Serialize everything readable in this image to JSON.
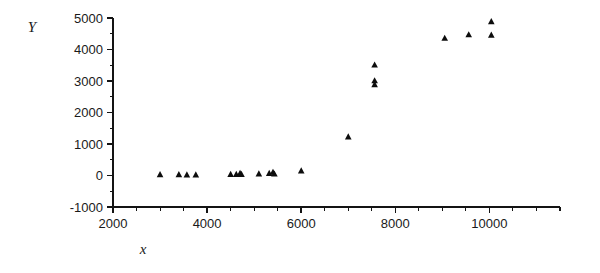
{
  "chart_data": {
    "type": "scatter",
    "title": "",
    "xlabel": "x",
    "ylabel": "Y",
    "xlim": [
      2000,
      11500
    ],
    "ylim": [
      -1000,
      5000
    ],
    "grid": false,
    "legend": null,
    "marker": "triangle",
    "marker_color": "#0d0d0d",
    "xticks": [
      2000,
      4000,
      6000,
      8000,
      10000
    ],
    "xtick_labels": [
      "2000",
      "4000",
      "6000",
      "8000",
      "10000"
    ],
    "xminor_step": 500,
    "yticks": [
      -1000,
      0,
      1000,
      2000,
      3000,
      4000,
      5000
    ],
    "ytick_labels": [
      "-1000",
      "0",
      "1000",
      "2000",
      "3000",
      "4000",
      "5000"
    ],
    "yminor_step": 500,
    "points": [
      {
        "x": 3000,
        "y": 20
      },
      {
        "x": 3400,
        "y": 20
      },
      {
        "x": 3570,
        "y": 15
      },
      {
        "x": 3760,
        "y": 15
      },
      {
        "x": 4500,
        "y": 25
      },
      {
        "x": 4620,
        "y": 30
      },
      {
        "x": 4700,
        "y": 60
      },
      {
        "x": 4730,
        "y": 25
      },
      {
        "x": 5100,
        "y": 45
      },
      {
        "x": 5320,
        "y": 60
      },
      {
        "x": 5400,
        "y": 95
      },
      {
        "x": 5430,
        "y": 40
      },
      {
        "x": 6000,
        "y": 140
      },
      {
        "x": 7000,
        "y": 1220
      },
      {
        "x": 7560,
        "y": 3500
      },
      {
        "x": 7560,
        "y": 3000
      },
      {
        "x": 7560,
        "y": 2880
      },
      {
        "x": 9050,
        "y": 4350
      },
      {
        "x": 9560,
        "y": 4460
      },
      {
        "x": 10040,
        "y": 4880
      },
      {
        "x": 10040,
        "y": 4450
      }
    ]
  },
  "axes": {
    "y_title": "Y",
    "x_title": "x"
  }
}
